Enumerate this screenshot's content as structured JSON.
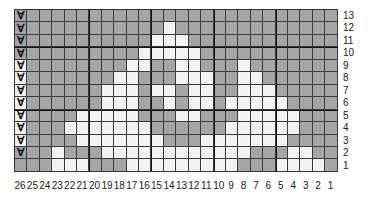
{
  "chart_data": {
    "type": "heatmap",
    "title": "",
    "colors": {
      "dark": "#a5a5a5",
      "light": "#f2f2f2",
      "gridline": "#3a3a3a"
    },
    "columns": [
      26,
      25,
      24,
      23,
      22,
      21,
      20,
      19,
      18,
      17,
      16,
      15,
      14,
      13,
      12,
      11,
      10,
      9,
      8,
      7,
      6,
      5,
      4,
      3,
      2,
      1
    ],
    "rows": [
      13,
      12,
      11,
      10,
      9,
      8,
      7,
      6,
      5,
      4,
      3,
      2,
      1
    ],
    "arrow_symbol": "Ɐ",
    "arrow_rows": [
      13,
      12,
      11,
      10,
      9,
      8,
      7,
      6,
      5,
      4,
      3,
      2
    ],
    "grid": [
      "AGGGGGGGGGGGGGGGGGGGGGGGGG",
      "AGGGGGGGGGGGWGGGGGGGGGGGGG",
      "AGGGGGGGGGGWWWGGGGGGGGGGGG",
      "AGGGGGGGGGWWWWWGGGGGGGGGGG",
      "BGGGGGGGGWWGGWWGGGWGGGGGGG",
      "BGGGGGGGWWGGGWWWGGWWGGGGGG",
      "BGGGGGGWWWGWWGWWGGWWWGGGGG",
      "BGGGGGGWWWGGWGWWGWWWWWGGGG",
      "BGGGGWWWWWGGGWWGGGWWWWWGGG",
      "BGGGWWWWWWWGGGGGGWWWWWWGGG",
      "BGGGGWWWWWWWGGGWWWWWWWGGGG",
      "AGGWGGGWWWWWWWWWWWWGGGWWGG",
      "GGGWWWGGGWWWWWWWWWGGGWWWWG"
    ],
    "legend": {
      "G": "dark (gray)",
      "W": "light (white)",
      "A": "gray with arrow",
      "B": "white with arrow"
    }
  },
  "labels": {
    "rows": [
      "13",
      "12",
      "11",
      "10",
      "9",
      "8",
      "7",
      "6",
      "5",
      "4",
      "3",
      "2",
      "1"
    ],
    "columns": [
      "26",
      "25",
      "24",
      "23",
      "22",
      "21",
      "20",
      "19",
      "18",
      "17",
      "16",
      "15",
      "14",
      "13",
      "12",
      "11",
      "10",
      "9",
      "8",
      "7",
      "6",
      "5",
      "4",
      "3",
      "2",
      "1"
    ]
  }
}
